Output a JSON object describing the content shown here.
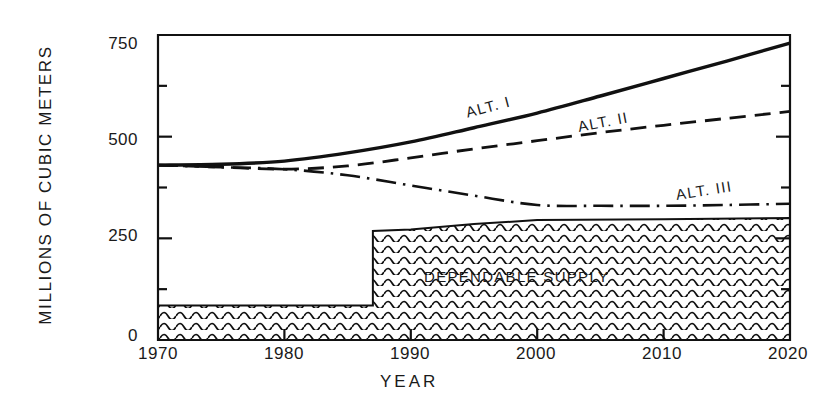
{
  "chart_data": {
    "type": "line",
    "title": "",
    "xlabel": "YEAR",
    "ylabel": "MILLIONS OF CUBIC METERS",
    "xlim": [
      1970,
      2020
    ],
    "ylim": [
      0,
      750
    ],
    "xticks": [
      1970,
      1980,
      1990,
      2000,
      2010,
      2020
    ],
    "xtick_labels": [
      "1970",
      "1980",
      "1990",
      "2000",
      "2010",
      "2020"
    ],
    "yticks": [
      0,
      250,
      500,
      750
    ],
    "ytick_labels": [
      "0",
      "250",
      "500",
      "750"
    ],
    "yminorticks": [
      125,
      375,
      625
    ],
    "grid": false,
    "legend_position": "inline-labels",
    "series": [
      {
        "name": "ALT. I",
        "style": "solid",
        "label_text": "ALT. I",
        "x": [
          1970,
          1975,
          1980,
          1985,
          1990,
          1995,
          2000,
          2005,
          2010,
          2015,
          2020
        ],
        "y": [
          430,
          432,
          440,
          460,
          487,
          522,
          558,
          600,
          643,
          686,
          730
        ]
      },
      {
        "name": "ALT. II",
        "style": "dashed",
        "label_text": "ALT. II",
        "x": [
          1970,
          1975,
          1980,
          1985,
          1990,
          1995,
          2000,
          2005,
          2010,
          2015,
          2020
        ],
        "y": [
          430,
          425,
          420,
          428,
          448,
          470,
          490,
          510,
          528,
          545,
          562
        ]
      },
      {
        "name": "ALT. III",
        "style": "dashdot",
        "label_text": "ALT. III",
        "x": [
          1970,
          1975,
          1980,
          1985,
          1990,
          1995,
          2000,
          2005,
          2010,
          2015,
          2020
        ],
        "y": [
          430,
          425,
          420,
          405,
          380,
          355,
          332,
          330,
          330,
          332,
          335
        ]
      }
    ],
    "filled_area": {
      "name": "DEPENDABLE SUPPLY",
      "label_text": "DEPENDABLE  SUPPLY",
      "hatch": "wavy-horizontal",
      "x": [
        1970,
        1987,
        1987,
        1990,
        1995,
        2000,
        2010,
        2020
      ],
      "y": [
        85,
        85,
        268,
        272,
        285,
        295,
        297,
        300
      ],
      "baseline": 0
    },
    "annotations": []
  }
}
